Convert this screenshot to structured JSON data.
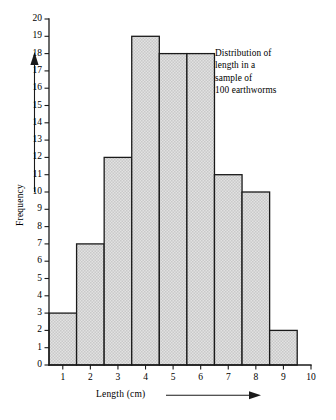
{
  "chart_data": {
    "type": "bar",
    "title": "",
    "annotation_lines": [
      "Distribution of",
      "length in a",
      "sample of",
      "100 earthworms"
    ],
    "xlabel": "Length (cm)",
    "ylabel": "Frequency",
    "categories": [
      1,
      2,
      3,
      4,
      5,
      6,
      7,
      8,
      9
    ],
    "values": [
      3,
      7,
      12,
      19,
      18,
      18,
      11,
      10,
      2
    ],
    "total": 100,
    "bar_width": 1,
    "bar_alignment": "centered-on-tick",
    "xlim": [
      0.5,
      10
    ],
    "ylim": [
      0,
      20
    ],
    "xticks": [
      1,
      2,
      3,
      4,
      5,
      6,
      7,
      8,
      9,
      10
    ],
    "yticks": [
      0,
      1,
      2,
      3,
      4,
      5,
      6,
      7,
      8,
      9,
      10,
      11,
      12,
      13,
      14,
      15,
      16,
      17,
      18,
      19,
      20
    ],
    "grid": false,
    "legend": "none",
    "bar_fill_color": "#d9d9d9",
    "bar_edge_color": "#1a1a1a",
    "axis_color": "#1a1a1a",
    "background_color": "#ffffff",
    "xaxis_has_arrow": true,
    "yaxis_has_arrow": true
  }
}
